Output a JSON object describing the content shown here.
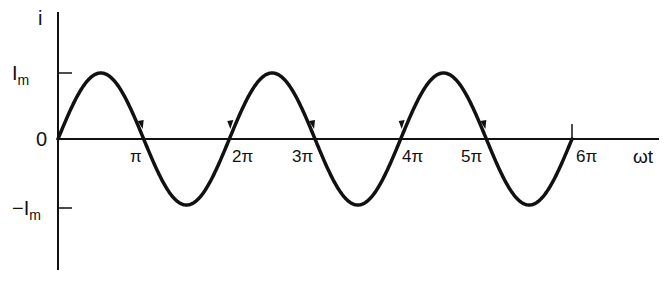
{
  "diagram": {
    "title": "",
    "y_axis_label": "i",
    "x_axis_label": "ωt",
    "y_ticks": [
      {
        "label": "I",
        "sub": "m",
        "value": 1
      },
      {
        "label": "0",
        "value": 0
      },
      {
        "label": "−I",
        "sub": "m",
        "value": -1
      }
    ],
    "x_ticks": [
      "π",
      "2π",
      "3π",
      "4π",
      "5π",
      "6π"
    ],
    "curve": "sine",
    "colors": {
      "stroke": "#111111",
      "background": "#ffffff"
    }
  },
  "chart_data": {
    "type": "line",
    "title": "",
    "xlabel": "ωt",
    "ylabel": "i",
    "x": [
      "0",
      "π/2",
      "π",
      "3π/2",
      "2π",
      "5π/2",
      "3π",
      "7π/2",
      "4π",
      "9π/2",
      "5π",
      "11π/2",
      "6π"
    ],
    "series": [
      {
        "name": "i = Im sin(ωt)",
        "values": [
          0,
          1,
          0,
          -1,
          0,
          1,
          0,
          -1,
          0,
          1,
          0,
          -1,
          0
        ]
      }
    ],
    "xlim": [
      "0",
      "6π"
    ],
    "ylim": [
      -1,
      1
    ],
    "y_tick_labels": [
      "Im",
      "0",
      "−Im"
    ],
    "x_tick_labels": [
      "π",
      "2π",
      "3π",
      "4π",
      "5π",
      "6π"
    ],
    "grid": false
  }
}
